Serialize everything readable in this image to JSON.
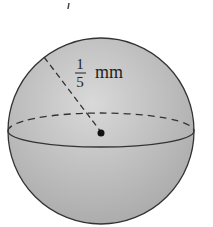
{
  "diagram": {
    "shape": "sphere",
    "radius_label": {
      "numerator": "1",
      "denominator": "5",
      "unit": "mm"
    },
    "colors": {
      "fill_light": "#d8d8d8",
      "fill_dark": "#a8a8a8",
      "stroke": "#333333"
    }
  }
}
